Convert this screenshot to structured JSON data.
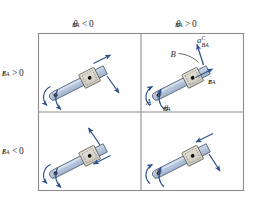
{
  "figure": {
    "name": "rotating-rod-collar-matrix",
    "type": "engineering-diagram",
    "background_color": "#ffffff"
  },
  "colors": {
    "rod_fill": "#b6c6dc",
    "rod_fill_light": "#ccd8e8",
    "rod_outline": "#4a5a73",
    "collar_fill": "#d8d6cc",
    "collar_outline": "#5c5c55",
    "arrow_blue": "#2c4f8c",
    "frame_line": "#8e8e8e",
    "text": "#2b2b2b",
    "pin_dot": "#111111"
  },
  "headers": {
    "columns": [
      {
        "id": "col-theta-dot-negative",
        "symbol": "θ",
        "accent": "·",
        "subscript": "BA",
        "operator": "<",
        "value": "0",
        "text": "θ̇BA < 0"
      },
      {
        "id": "col-theta-dot-positive",
        "symbol": "θ",
        "accent": "·",
        "subscript": "BA",
        "operator": ">",
        "value": "0",
        "text": "θ̇BA > 0"
      }
    ],
    "rows": [
      {
        "id": "row-r-dot-positive",
        "symbol": "r",
        "accent": "·",
        "subscript": "BA",
        "operator": ">",
        "value": "0",
        "text": "ṙBA > 0"
      },
      {
        "id": "row-r-dot-negative",
        "symbol": "r",
        "accent": "·",
        "subscript": "BA",
        "operator": "<",
        "value": "0",
        "text": "ṙBA < 0"
      }
    ]
  },
  "cells": [
    {
      "id": "cell-top-left",
      "row": "ṙBA > 0",
      "column": "θ̇BA < 0",
      "rotation_sense": "clockwise",
      "slide_direction": "outward-up-right",
      "coriolis_direction": "down-right",
      "labels": []
    },
    {
      "id": "cell-top-right",
      "row": "ṙBA > 0",
      "column": "θ̇BA > 0",
      "rotation_sense": "counterclockwise",
      "slide_direction": "outward-up-right",
      "coriolis_direction": "up-left",
      "labels": [
        {
          "id": "label-point-A",
          "symbol": "A",
          "subscript": "",
          "superscript": "",
          "text": "A"
        },
        {
          "id": "label-point-B",
          "symbol": "B",
          "subscript": "",
          "superscript": "",
          "text": "B"
        },
        {
          "id": "label-coriolis-acceleration",
          "symbol": "a",
          "subscript": "BA",
          "superscript": "C",
          "text": "aᶜBA"
        },
        {
          "id": "label-r-dot-vector",
          "symbol": "r",
          "accent": "·",
          "subscript": "BA",
          "text": "ṙBA"
        },
        {
          "id": "label-theta-dot-vector",
          "symbol": "θ",
          "accent": "·",
          "subscript": "BA",
          "text": "θ̇BA"
        }
      ]
    },
    {
      "id": "cell-bottom-left",
      "row": "ṙBA < 0",
      "column": "θ̇BA < 0",
      "rotation_sense": "clockwise",
      "slide_direction": "inward-down-left",
      "coriolis_direction": "up-left",
      "labels": []
    },
    {
      "id": "cell-bottom-right",
      "row": "ṙBA < 0",
      "column": "θ̇BA > 0",
      "rotation_sense": "counterclockwise",
      "slide_direction": "inward-down-left",
      "coriolis_direction": "down-right",
      "labels": []
    }
  ]
}
